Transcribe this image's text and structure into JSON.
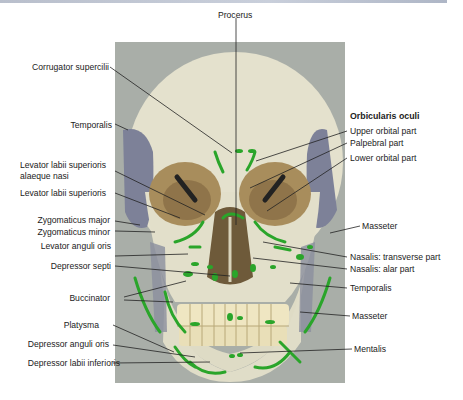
{
  "figure": {
    "colors": {
      "background": "#ffffff",
      "photo_backdrop": "#a9aea8",
      "bone": "#e6e3cf",
      "orbit": "#a88d5c",
      "temporalis_region": "#7d8198",
      "muscle_marking": "#2aa52a",
      "leader_line": "#222222"
    }
  },
  "labels": {
    "top": {
      "procerus": "Procerus"
    },
    "left": {
      "corrugator": "Corrugator supercilii",
      "temporalis": "Temporalis",
      "llsan_line1": "Levator labii superioris",
      "llsan_line2": "alaeque nasi",
      "lls": "Levator labii superioris",
      "zyg_major": "Zygomaticus major",
      "zyg_minor": "Zygomaticus minor",
      "lev_anguli": "Levator anguli oris",
      "dep_septi": "Depressor septi",
      "buccinator": "Buccinator",
      "platysma": "Platysma",
      "dep_anguli": "Depressor anguli oris",
      "dep_labii": "Depressor labii inferioris"
    },
    "right": {
      "orbicularis_heading": "Orbicularis oculi",
      "upper_orbital": "Upper orbital part",
      "palpebral": "Palpebral part",
      "lower_orbital": "Lower orbital part",
      "masseter_upper": "Masseter",
      "nasalis_transverse": "Nasalis: transverse part",
      "nasalis_alar": "Nasalis: alar part",
      "temporalis": "Temporalis",
      "masseter_lower": "Masseter",
      "mentalis": "Mentalis"
    }
  }
}
